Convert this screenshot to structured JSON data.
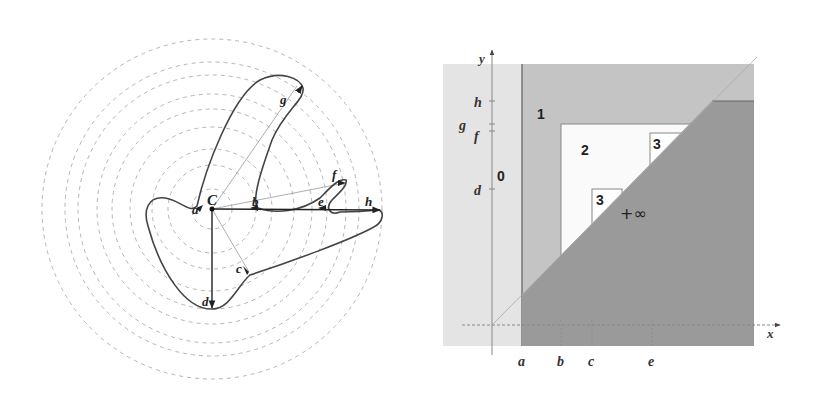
{
  "figures": {
    "left": {
      "title": "Curve around center C with concentric distance circles",
      "center_label": "C",
      "point_labels": {
        "a": "a",
        "b": "b",
        "c": "c",
        "d": "d",
        "e": "e",
        "f": "f",
        "g": "g",
        "h": "h"
      },
      "circle_count": 9
    },
    "right": {
      "axis_labels": {
        "x": "x",
        "y": "y"
      },
      "x_ticks": [
        "a",
        "b",
        "c",
        "e"
      ],
      "y_ticks": [
        "h",
        "g",
        "f",
        "d"
      ],
      "regions": {
        "zero": "0",
        "one": "1",
        "two": "2",
        "three_upper": "3",
        "three_lower": "3",
        "infinity": "+∞"
      }
    }
  },
  "colors": {
    "curve": "#444444",
    "dashed_circle": "#b0b0b0",
    "region_0": "#e4e4e4",
    "region_1": "#c4c4c4",
    "region_2": "#fafafa",
    "region_3": "#ffffff",
    "region_inf": "#9a9a9a",
    "axis": "#888888"
  }
}
